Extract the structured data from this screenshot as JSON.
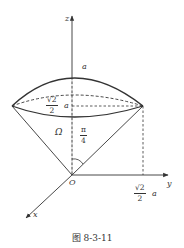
{
  "figure": {
    "caption": "图 8-3-11",
    "axes": {
      "x_label": "x",
      "y_label": "y",
      "z_label": "z",
      "origin_label": "O"
    },
    "labels": {
      "cap_top": "a",
      "rim_height_num": "√2",
      "rim_height_den": "2",
      "rim_height_suffix": "a",
      "region": "Ω",
      "half_angle_num": "π",
      "half_angle_den": "4",
      "rim_radius_num": "√2",
      "rim_radius_den": "2",
      "rim_radius_suffix": "a"
    }
  }
}
